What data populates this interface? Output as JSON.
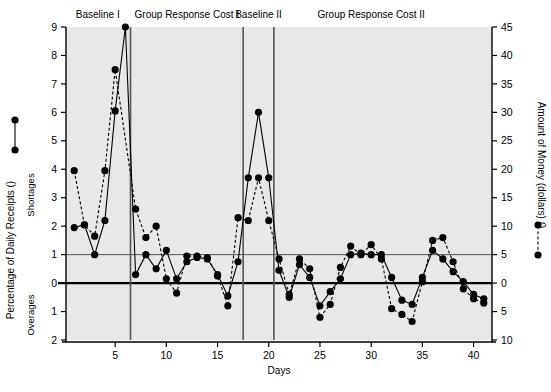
{
  "chart_data": {
    "type": "line",
    "title": "",
    "xlabel": "Days",
    "ylabel_left": "Percentage of Daily Receipts (",
    "ylabel_left_suffix": ")",
    "ylabel_right": "Amount of Money (dollars) (",
    "ylabel_right_suffix": ")",
    "ylabel_left_upper": "Shortages",
    "ylabel_left_lower": "Overages",
    "grid": true,
    "gridline_values": [
      1,
      0
    ],
    "legend_position": "axis-labels",
    "xlim": [
      0.2,
      41.8
    ],
    "xticks": [
      5,
      10,
      15,
      20,
      25,
      30,
      35,
      40
    ],
    "xtick_labels": [
      "5",
      "10",
      "15",
      "20",
      "25",
      "30",
      "35",
      "40"
    ],
    "ylim_left": [
      -2,
      9
    ],
    "yticks_left": [
      9,
      8,
      7,
      6,
      5,
      4,
      3,
      2,
      1,
      0,
      -1,
      -2
    ],
    "ytick_labels_left": [
      "9",
      "8",
      "7",
      "6",
      "5",
      "4",
      "3",
      "2",
      "1",
      "0",
      "1",
      "2"
    ],
    "ylim_right": [
      -10,
      45
    ],
    "yticks_right": [
      45,
      40,
      35,
      30,
      25,
      20,
      15,
      10,
      5,
      0,
      -5,
      -10
    ],
    "ytick_labels_right": [
      "45",
      "40",
      "35",
      "30",
      "25",
      "20",
      "15",
      "10",
      "5",
      "0",
      "5",
      "10"
    ],
    "right_scale_factor": 5,
    "phases": [
      {
        "label": "Baseline I",
        "start": 0.2,
        "end": 6.5,
        "label_x": 3.3
      },
      {
        "label": "Group Response Cost I",
        "start": 6.5,
        "end": 17.5,
        "label_x": 12.0
      },
      {
        "label": "Baseline II",
        "start": 17.5,
        "end": 20.5,
        "label_x": 19.0
      },
      {
        "label": "Group Response Cost II",
        "start": 20.5,
        "end": 41.8,
        "label_x": 30.0
      }
    ],
    "phase_divider_x": [
      6.5,
      17.5,
      20.5
    ],
    "series": [
      {
        "name": "Percentage of Daily Receipts",
        "axis": "left",
        "linestyle": "solid",
        "marker": "filled-circle",
        "color": "#000000",
        "x": [
          1,
          2,
          3,
          4,
          5,
          6,
          7,
          8,
          9,
          10,
          11,
          12,
          13,
          14,
          15,
          16,
          17,
          18,
          19,
          20,
          21,
          22,
          23,
          24,
          25,
          26,
          27,
          28,
          29,
          30,
          31,
          32,
          33,
          34,
          35,
          36,
          37,
          38,
          39,
          40,
          41
        ],
        "values": [
          1.95,
          2.05,
          1.0,
          2.2,
          6.05,
          9.0,
          0.3,
          1.0,
          0.5,
          1.15,
          0.15,
          0.75,
          0.9,
          0.85,
          0.3,
          -0.45,
          0.75,
          3.7,
          6.0,
          3.7,
          0.45,
          -0.5,
          0.65,
          0.2,
          -0.8,
          -0.3,
          0.15,
          1.0,
          1.05,
          1.0,
          1.0,
          0.2,
          -0.6,
          -0.75,
          0.2,
          1.15,
          0.85,
          0.4,
          0.05,
          -0.4,
          -0.55
        ]
      },
      {
        "name": "Amount of Money (dollars)",
        "axis": "right",
        "linestyle": "dashed",
        "marker": "filled-circle",
        "color": "#000000",
        "x": [
          1,
          2,
          3,
          4,
          5,
          7,
          8,
          9,
          10,
          11,
          12,
          13,
          14,
          15,
          16,
          17,
          18,
          19,
          20,
          21,
          22,
          23,
          24,
          25,
          26,
          27,
          28,
          29,
          30,
          31,
          32,
          33,
          34,
          35,
          36,
          37,
          38,
          39,
          40,
          41
        ],
        "values_left_units": [
          3.95,
          2.05,
          1.65,
          3.95,
          7.5,
          2.6,
          1.6,
          2.0,
          0.15,
          -0.35,
          0.95,
          0.95,
          0.9,
          0.25,
          -0.8,
          2.3,
          2.2,
          3.7,
          2.2,
          0.85,
          -0.4,
          0.85,
          0.5,
          -1.2,
          -0.75,
          0.55,
          1.3,
          1.0,
          1.35,
          0.85,
          -0.9,
          -1.1,
          -1.35,
          0.05,
          1.5,
          1.6,
          0.75,
          -0.2,
          -0.55,
          -0.7
        ]
      }
    ]
  },
  "axes": {
    "x_title": "Days",
    "left_title_main": "Percentage of Daily Receipts (",
    "left_title_close": ")",
    "left_sub_upper": "Shortages",
    "left_sub_lower": "Overages",
    "right_title_main": "Amount of Money (dollars) (",
    "right_title_close": ")"
  },
  "legend": {
    "left_symbol": "solid-line-filled-circles",
    "right_symbol": "dashed-line-filled-circles"
  },
  "colors": {
    "plot_background": "#e8e8e8",
    "page_background": "#ffffff",
    "line": "#000000",
    "marker": "#000000",
    "gridline": "#555555",
    "zero_line": "#000000",
    "phase_divider": "#555555",
    "axis": "#000000"
  }
}
